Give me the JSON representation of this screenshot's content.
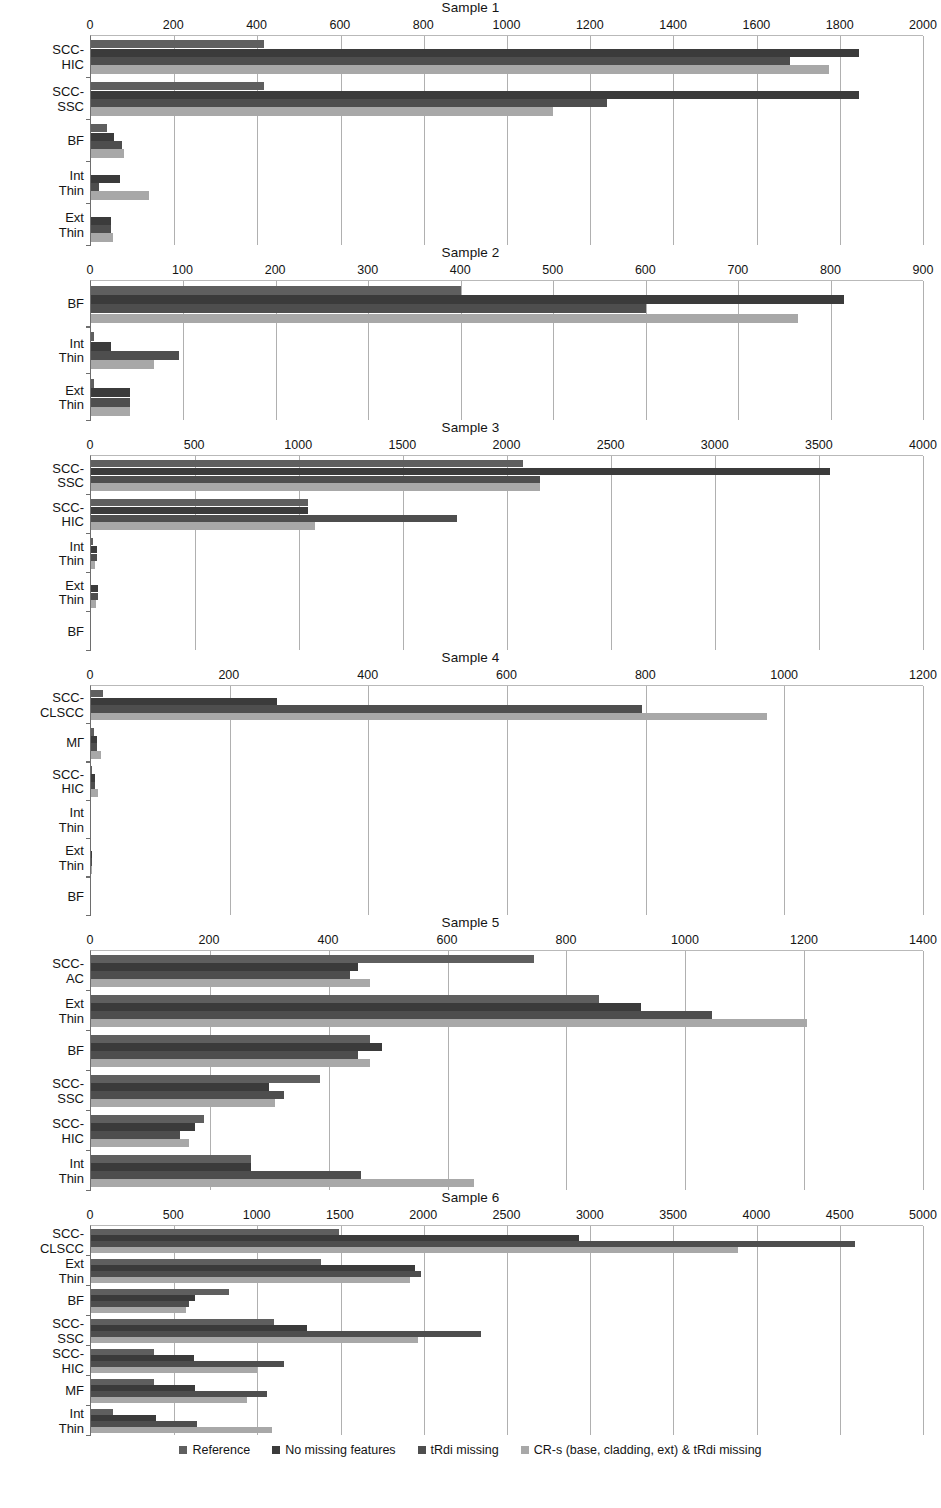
{
  "figure": {
    "legend": [
      {
        "label": "Reference",
        "color": "#5f5f5f"
      },
      {
        "label": "No missing features",
        "color": "#3b3b3b"
      },
      {
        "label": "tRdi missing",
        "color": "#4e4e4e"
      },
      {
        "label": "CR-s (base, cladding, ext) & tRdi missing",
        "color": "#a8a8a8"
      }
    ]
  },
  "chart_data": [
    {
      "type": "bar",
      "orientation": "horizontal",
      "title": "Sample 1",
      "xlabel": "",
      "ylabel": "",
      "xlim": [
        0,
        2000
      ],
      "xticks": [
        0,
        200,
        400,
        600,
        800,
        1000,
        1200,
        1400,
        1600,
        1800,
        2000
      ],
      "grid": true,
      "legend_position": "bottom",
      "categories": [
        "SCC-\nHIC",
        "SCC-\nSSC",
        "BF",
        "Int\nThin",
        "Ext\nThin"
      ],
      "series": [
        {
          "name": "Reference",
          "values": [
            415,
            415,
            38,
            0,
            0
          ]
        },
        {
          "name": "No missing features",
          "values": [
            1845,
            1845,
            55,
            70,
            48
          ]
        },
        {
          "name": "tRdi missing",
          "values": [
            1680,
            1240,
            75,
            20,
            48
          ]
        },
        {
          "name": "CR-s (base, cladding, ext) & tRdi missing",
          "values": [
            1775,
            1110,
            80,
            140,
            52
          ]
        }
      ]
    },
    {
      "type": "bar",
      "orientation": "horizontal",
      "title": "Sample 2",
      "xlabel": "",
      "ylabel": "",
      "xlim": [
        0,
        900
      ],
      "xticks": [
        0,
        100,
        200,
        300,
        400,
        500,
        600,
        700,
        800,
        900
      ],
      "grid": true,
      "legend_position": "bottom",
      "categories": [
        "BF",
        "Int\nThin",
        "Ext\nThin"
      ],
      "series": [
        {
          "name": "Reference",
          "values": [
            400,
            3,
            3
          ]
        },
        {
          "name": "No missing features",
          "values": [
            815,
            22,
            42
          ]
        },
        {
          "name": "tRdi missing",
          "values": [
            600,
            95,
            42
          ]
        },
        {
          "name": "CR-s (base, cladding, ext) & tRdi missing",
          "values": [
            765,
            68,
            42
          ]
        }
      ]
    },
    {
      "type": "bar",
      "orientation": "horizontal",
      "title": "Sample 3",
      "xlabel": "",
      "ylabel": "",
      "xlim": [
        0,
        4000
      ],
      "xticks": [
        0,
        500,
        1000,
        1500,
        2000,
        2500,
        3000,
        3500,
        4000
      ],
      "grid": true,
      "legend_position": "bottom",
      "categories": [
        "SCC-\nSSC",
        "SCC-\nHIC",
        "Int\nThin",
        "Ext\nThin",
        "BF"
      ],
      "series": [
        {
          "name": "Reference",
          "values": [
            2075,
            1045,
            10,
            0,
            0
          ]
        },
        {
          "name": "No missing features",
          "values": [
            3555,
            1045,
            30,
            35,
            0
          ]
        },
        {
          "name": "tRdi missing",
          "values": [
            2160,
            1760,
            30,
            35,
            0
          ]
        },
        {
          "name": "CR-s (base, cladding, ext) & tRdi missing",
          "values": [
            2160,
            1075,
            20,
            25,
            0
          ]
        }
      ]
    },
    {
      "type": "bar",
      "orientation": "horizontal",
      "title": "Sample 4",
      "xlabel": "",
      "ylabel": "",
      "xlim": [
        0,
        1200
      ],
      "xticks": [
        0,
        200,
        400,
        600,
        800,
        1000,
        1200
      ],
      "grid": true,
      "legend_position": "bottom",
      "categories": [
        "SCC-\nCLSCC",
        "MГ",
        "SCC-\nHIC",
        "Int\nThin",
        "Ext\nThin",
        "BF"
      ],
      "series": [
        {
          "name": "Reference",
          "values": [
            18,
            4,
            2,
            0,
            0,
            0
          ]
        },
        {
          "name": "No missing features",
          "values": [
            268,
            9,
            6,
            0,
            2,
            0
          ]
        },
        {
          "name": "tRdi missing",
          "values": [
            795,
            9,
            6,
            0,
            2,
            0
          ]
        },
        {
          "name": "CR-s (base, cladding, ext) & tRdi missing",
          "values": [
            975,
            14,
            10,
            0,
            2,
            0
          ]
        }
      ]
    },
    {
      "type": "bar",
      "orientation": "horizontal",
      "title": "Sample 5",
      "xlabel": "",
      "ylabel": "",
      "xlim": [
        0,
        1400
      ],
      "xticks": [
        0,
        200,
        400,
        600,
        800,
        1000,
        1200,
        1400
      ],
      "grid": true,
      "legend_position": "bottom",
      "categories": [
        "SCC-\nAC",
        "Ext\nThin",
        "BF",
        "SCC-\nSSC",
        "SCC-\nHIC",
        "Int\nThin"
      ],
      "series": [
        {
          "name": "Reference",
          "values": [
            745,
            855,
            470,
            385,
            190,
            270
          ]
        },
        {
          "name": "No missing features",
          "values": [
            450,
            925,
            490,
            300,
            175,
            270
          ]
        },
        {
          "name": "tRdi missing",
          "values": [
            435,
            1045,
            450,
            325,
            150,
            455
          ]
        },
        {
          "name": "CR-s (base, cladding, ext) & tRdi missing",
          "values": [
            470,
            1205,
            470,
            310,
            165,
            645
          ]
        }
      ]
    },
    {
      "type": "bar",
      "orientation": "horizontal",
      "title": "Sample 6",
      "xlabel": "",
      "ylabel": "",
      "xlim": [
        0,
        5000
      ],
      "xticks": [
        0,
        500,
        1000,
        1500,
        2000,
        2500,
        3000,
        3500,
        4000,
        4500,
        5000
      ],
      "grid": true,
      "legend_position": "bottom",
      "categories": [
        "SCC-\nCLSCC",
        "Ext\nThin",
        "BF",
        "SCC-\nSSC",
        "SCC-\nHIC",
        "MF",
        "Int\nThin"
      ],
      "series": [
        {
          "name": "Reference",
          "values": [
            1490,
            1380,
            830,
            1100,
            380,
            380,
            130
          ]
        },
        {
          "name": "No missing features",
          "values": [
            2930,
            1950,
            625,
            1300,
            620,
            625,
            390
          ]
        },
        {
          "name": "tRdi missing",
          "values": [
            4590,
            1985,
            590,
            2345,
            1160,
            1060,
            640
          ]
        },
        {
          "name": "CR-s (base, cladding, ext) & tRdi missing",
          "values": [
            3890,
            1920,
            570,
            1965,
            995,
            940,
            1090
          ]
        }
      ]
    }
  ]
}
